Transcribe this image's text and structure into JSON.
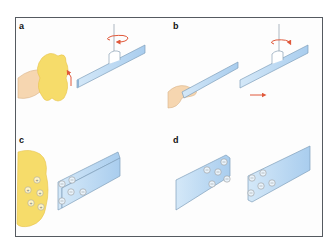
{
  "figure": {
    "panels": [
      {
        "label": "a",
        "description": "Hand rubs a strip with fur/wool cloth; strip suspended from thread rotates"
      },
      {
        "label": "b",
        "description": "Second rubbed strip brought near suspended strip; suspended strip is repelled"
      },
      {
        "label": "c",
        "description": "Cloth acquires positive charges, strip acquires negative charges"
      },
      {
        "label": "d",
        "description": "Two negatively charged strips"
      }
    ],
    "charges": {
      "positive_symbol": "+",
      "negative_symbol": "−",
      "cloth_positive_count": 5,
      "strip_c_negative_count": 5,
      "strip_d_left_negative_count": 5,
      "strip_d_right_negative_count": 5
    },
    "colors": {
      "frame": "#555a60",
      "strip_fill": "#b9d8f2",
      "strip_edge": "#7f9fba",
      "cloth": "#f6dc6a",
      "hand": "#f6d6b0",
      "arrow": "#e0583a"
    }
  }
}
